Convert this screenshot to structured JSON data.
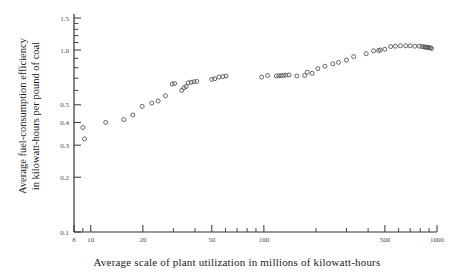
{
  "figure": {
    "background": "#ffffff",
    "ink_color": "#333333",
    "marker_color": "#555555"
  },
  "labels": {
    "ylabel_line1": "Average fuel-consumption efficiency",
    "ylabel_line2": "in kilowatt-hours per pound of coal",
    "xlabel": "Average scale of plant utilization in millions of kilowatt-hours"
  },
  "chart_data": {
    "type": "scatter",
    "title": "",
    "xlabel": "Average scale of plant utilization in millions of kilowatt-hours",
    "ylabel": "Average fuel-consumption efficiency in kilowatt-hours per pound of coal",
    "xscale": "log",
    "yscale": "log",
    "xlim": [
      8,
      1000
    ],
    "ylim": [
      0.1,
      1.5
    ],
    "grid": false,
    "legend": "none",
    "xticks": [
      8,
      10,
      20,
      50,
      100,
      500,
      1000
    ],
    "xticklabels": [
      "8",
      "10",
      "20",
      "50",
      "100",
      "500",
      "1000"
    ],
    "xminorticks": [
      9,
      30,
      40,
      60,
      70,
      80,
      90,
      200,
      300,
      400,
      600,
      700,
      800,
      900
    ],
    "yticks": [
      0.1,
      0.2,
      0.3,
      0.4,
      0.5,
      1.0,
      1.5
    ],
    "yticklabels": [
      "0.1",
      "0.2",
      "0.3",
      "0.4",
      "0.5",
      "1.0",
      "1.5"
    ],
    "yminorticks": [
      0.6,
      0.7,
      0.8,
      0.9,
      1.1,
      1.2,
      1.3,
      1.4
    ],
    "marker": "open-circle",
    "marker_size": 4.0,
    "series": [
      {
        "name": "plants",
        "x": [
          9.0,
          9.2,
          12.2,
          15.5,
          17.5,
          19.8,
          22.5,
          24.5,
          27.0,
          29.5,
          30.5,
          33.5,
          34.5,
          35.5,
          36.5,
          38.0,
          39.5,
          41.0,
          50.0,
          52.0,
          55.0,
          58.0,
          60.5,
          97.0,
          105.0,
          118.0,
          122.0,
          126.0,
          130.0,
          134.0,
          140.0,
          155.0,
          172.0,
          178.0,
          190.0,
          205.0,
          225.0,
          250.0,
          270.0,
          300.0,
          330.0,
          390.0,
          430.0,
          460.0,
          470.0,
          500.0,
          540.0,
          575.0,
          615.0,
          660.0,
          700.0,
          745.0,
          790.0,
          820.0,
          840.0,
          855.0,
          870.0,
          885.0,
          900.0,
          915.0,
          930.0
        ],
        "y": [
          0.375,
          0.325,
          0.4,
          0.415,
          0.44,
          0.49,
          0.512,
          0.525,
          0.56,
          0.65,
          0.655,
          0.6,
          0.62,
          0.63,
          0.66,
          0.665,
          0.67,
          0.672,
          0.69,
          0.695,
          0.71,
          0.715,
          0.72,
          0.71,
          0.725,
          0.72,
          0.722,
          0.724,
          0.726,
          0.728,
          0.73,
          0.72,
          0.725,
          0.755,
          0.745,
          0.79,
          0.815,
          0.84,
          0.855,
          0.88,
          0.92,
          0.955,
          0.99,
          0.995,
          1.0,
          1.01,
          1.045,
          1.05,
          1.055,
          1.055,
          1.055,
          1.05,
          1.05,
          1.045,
          1.04,
          1.038,
          1.036,
          1.034,
          1.032,
          1.028,
          1.02
        ]
      }
    ]
  }
}
